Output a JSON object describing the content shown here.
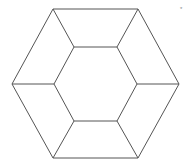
{
  "diagram": {
    "type": "nested-hexagon",
    "stroke_color": "#555555",
    "background": "#ffffff",
    "outer_hexagon": [
      [
        53,
        9
      ],
      [
        138,
        9
      ],
      [
        179,
        84
      ],
      [
        138,
        158
      ],
      [
        53,
        158
      ],
      [
        12,
        84
      ]
    ],
    "inner_hexagon": [
      [
        74,
        47
      ],
      [
        117,
        47
      ],
      [
        137,
        84
      ],
      [
        117,
        121
      ],
      [
        74,
        121
      ],
      [
        54,
        84
      ]
    ],
    "corner_mark": "*"
  }
}
